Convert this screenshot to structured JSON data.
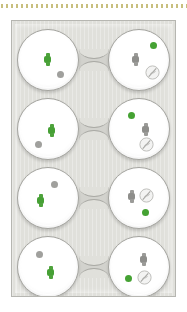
{
  "figure": {
    "kind": "microfluidic-chip-diagram",
    "background_color": "#ffffff"
  },
  "top_rule": {
    "name": "dotted-divider",
    "color": "#c8bf7e",
    "dash_count": 62,
    "dash_width_px": 2,
    "gap_px": 3
  },
  "panel": {
    "name": "chip-panel",
    "fill_color": "#e0e0db",
    "border_color": "#b6b6b1",
    "texture": "vertical-stripes"
  },
  "legend": {
    "green_color": "#46a035",
    "gray_color": "#9b9b98",
    "well_fill": "#ffffff",
    "well_border": "#a4a49f",
    "connector_fill": "#d2d2cd"
  },
  "rows": [
    {
      "id": "row-1",
      "left_well": {
        "id": "well-1L",
        "markers": [
          {
            "type": "watch",
            "color": "green",
            "x": 26,
            "y": 23
          },
          {
            "type": "dot",
            "color": "gray",
            "x": 39,
            "y": 41
          }
        ]
      },
      "right_well": {
        "id": "well-1R",
        "markers": [
          {
            "type": "dot",
            "color": "green",
            "x": 41,
            "y": 12
          },
          {
            "type": "watch",
            "color": "gray",
            "x": 23,
            "y": 23
          },
          {
            "type": "slashcircle",
            "color": "gray",
            "x": 36,
            "y": 35
          }
        ]
      }
    },
    {
      "id": "row-2",
      "left_well": {
        "id": "well-2L",
        "markers": [
          {
            "type": "watch",
            "color": "green",
            "x": 30,
            "y": 25
          },
          {
            "type": "dot",
            "color": "gray",
            "x": 17,
            "y": 42
          }
        ]
      },
      "right_well": {
        "id": "well-2R",
        "markers": [
          {
            "type": "dot",
            "color": "green",
            "x": 19,
            "y": 13
          },
          {
            "type": "watch",
            "color": "gray",
            "x": 33,
            "y": 24
          },
          {
            "type": "slashcircle",
            "color": "gray",
            "x": 30,
            "y": 38
          }
        ]
      }
    },
    {
      "id": "row-3",
      "left_well": {
        "id": "well-3L",
        "markers": [
          {
            "type": "dot",
            "color": "gray",
            "x": 33,
            "y": 13
          },
          {
            "type": "watch",
            "color": "green",
            "x": 19,
            "y": 26
          }
        ]
      },
      "right_well": {
        "id": "well-3R",
        "markers": [
          {
            "type": "watch",
            "color": "gray",
            "x": 19,
            "y": 22
          },
          {
            "type": "slashcircle",
            "color": "gray",
            "x": 30,
            "y": 20
          },
          {
            "type": "dot",
            "color": "green",
            "x": 33,
            "y": 41
          }
        ]
      }
    },
    {
      "id": "row-4",
      "left_well": {
        "id": "well-4L",
        "markers": [
          {
            "type": "dot",
            "color": "gray",
            "x": 18,
            "y": 14
          },
          {
            "type": "watch",
            "color": "green",
            "x": 29,
            "y": 29
          }
        ]
      },
      "right_well": {
        "id": "well-4R",
        "markers": [
          {
            "type": "watch",
            "color": "gray",
            "x": 31,
            "y": 16
          },
          {
            "type": "dot",
            "color": "green",
            "x": 16,
            "y": 38
          },
          {
            "type": "slashcircle",
            "color": "gray",
            "x": 28,
            "y": 33
          }
        ]
      }
    }
  ]
}
